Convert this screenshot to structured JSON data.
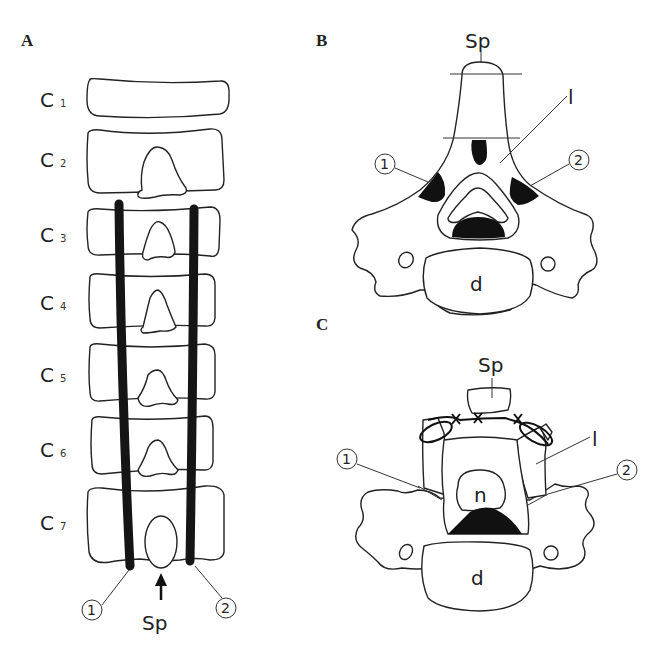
{
  "figure": {
    "panels": [
      {
        "id": "A",
        "letter": "A",
        "view": "posterior view of cervical spine C1–C7 with two rods",
        "vertebra_labels": [
          {
            "letter": "C",
            "sub": "1"
          },
          {
            "letter": "C",
            "sub": "2"
          },
          {
            "letter": "C",
            "sub": "3"
          },
          {
            "letter": "C",
            "sub": "4"
          },
          {
            "letter": "C",
            "sub": "5"
          },
          {
            "letter": "C",
            "sub": "6"
          },
          {
            "letter": "C",
            "sub": "7"
          }
        ],
        "callouts": {
          "one": "①",
          "two": "②",
          "sp": "Sp"
        }
      },
      {
        "id": "B",
        "letter": "B",
        "view": "axial cross-section of vertebra",
        "callouts": {
          "sp": "Sp",
          "l": "l",
          "one": "①",
          "two": "②",
          "d": "d"
        }
      },
      {
        "id": "C",
        "letter": "C",
        "view": "axial cross-section after laminoplasty with sutures",
        "callouts": {
          "sp": "Sp",
          "l": "l",
          "one": "①",
          "two": "②",
          "n": "n",
          "d": "d"
        }
      }
    ],
    "colors": {
      "line": "#222222",
      "fill_black": "#111111",
      "background": "#ffffff"
    }
  }
}
